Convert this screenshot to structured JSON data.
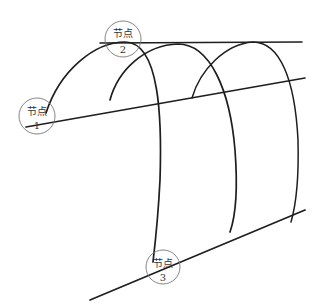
{
  "diagram": {
    "type": "arched-frame-sketch",
    "stroke_color": "#1e1e1e",
    "circle_color": "#777777",
    "nodes": [
      {
        "label": "节点",
        "number": "1",
        "cx": 37,
        "cy": 116,
        "r": 18
      },
      {
        "label": "节点",
        "number": "2",
        "cx": 123,
        "cy": 39,
        "r": 18
      },
      {
        "label": "节点",
        "number": "3",
        "cx": 163,
        "cy": 267,
        "r": 17
      }
    ]
  }
}
